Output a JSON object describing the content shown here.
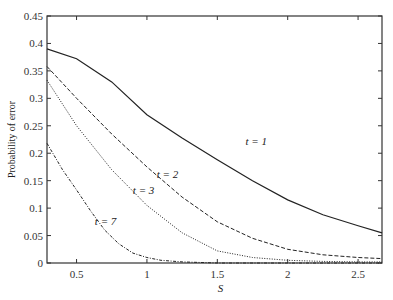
{
  "chart_data": {
    "type": "line",
    "title": "",
    "xlabel": "S",
    "ylabel": "Probability of error",
    "xlim": [
      0.29,
      2.67
    ],
    "ylim": [
      0,
      0.45
    ],
    "xticks": [
      "0.5",
      "1",
      "1.5",
      "2",
      "2.5"
    ],
    "yticks": [
      "0",
      "0.05",
      "0.1",
      "0.15",
      "0.2",
      "0.25",
      "0.3",
      "0.35",
      "0.4",
      "0.45"
    ],
    "grid": false,
    "legend": "inline labels",
    "series": [
      {
        "name": "t = 1",
        "style": "solid",
        "x": [
          0.29,
          0.5,
          0.75,
          1.0,
          1.25,
          1.5,
          1.75,
          2.0,
          2.25,
          2.5,
          2.67
        ],
        "y": [
          0.39,
          0.372,
          0.33,
          0.27,
          0.228,
          0.188,
          0.15,
          0.115,
          0.088,
          0.068,
          0.055
        ],
        "label_pos": [
          1.7,
          0.215
        ]
      },
      {
        "name": "t = 2",
        "style": "dashed",
        "x": [
          0.29,
          0.5,
          0.75,
          1.0,
          1.25,
          1.5,
          1.75,
          2.0,
          2.25,
          2.5,
          2.67
        ],
        "y": [
          0.358,
          0.3,
          0.235,
          0.175,
          0.12,
          0.075,
          0.045,
          0.025,
          0.015,
          0.01,
          0.008
        ],
        "label_pos": [
          1.07,
          0.155
        ]
      },
      {
        "name": "t = 3",
        "style": "dotted",
        "x": [
          0.29,
          0.5,
          0.75,
          1.0,
          1.25,
          1.5,
          1.75,
          2.0,
          2.25,
          2.5,
          2.67
        ],
        "y": [
          0.333,
          0.25,
          0.17,
          0.105,
          0.055,
          0.022,
          0.01,
          0.005,
          0.003,
          0.002,
          0.002
        ],
        "label_pos": [
          0.9,
          0.125
        ]
      },
      {
        "name": "t = 7",
        "style": "dash-dot",
        "x": [
          0.29,
          0.4,
          0.5,
          0.6,
          0.7,
          0.8,
          0.9,
          1.0,
          1.1,
          1.25,
          1.5,
          2.0,
          2.67
        ],
        "y": [
          0.218,
          0.17,
          0.133,
          0.095,
          0.06,
          0.035,
          0.018,
          0.01,
          0.005,
          0.002,
          0.0,
          0.0,
          0.0
        ],
        "label_pos": [
          0.63,
          0.07
        ]
      }
    ]
  }
}
